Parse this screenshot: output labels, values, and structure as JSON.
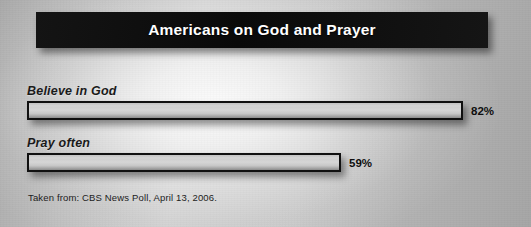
{
  "title": "Americans on God and Prayer",
  "footnote": "Taken from: CBS News Poll, April 13, 2006.",
  "colors": {
    "banner_background": "#0d0d0d",
    "banner_text": "#ffffff",
    "bar_fill": "#d6d6d6",
    "bar_border": "#101010",
    "label_text": "#1a1a1a",
    "page_background": "#c6c6c6"
  },
  "chart_data": {
    "type": "bar",
    "orientation": "horizontal",
    "title": "Americans on God and Prayer",
    "subtitle": "",
    "xlabel": "",
    "ylabel": "",
    "xlim": [
      0,
      100
    ],
    "grid": false,
    "legend": null,
    "value_suffix": "%",
    "categories": [
      "Believe in God",
      "Pray often"
    ],
    "values": [
      82,
      59
    ],
    "bars": [
      {
        "label": "Believe in God",
        "value": 82,
        "value_label": "82%"
      },
      {
        "label": "Pray often",
        "value": 59,
        "value_label": "59%"
      }
    ],
    "annotations": [
      "Taken from: CBS News Poll, April 13, 2006."
    ]
  }
}
